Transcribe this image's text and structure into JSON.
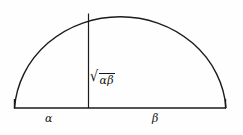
{
  "figure": {
    "kind": "geometric-mean-semicircle",
    "background_color": "#fefefe",
    "stroke_color": "#1b1b1b",
    "labels": {
      "left_segment": "α",
      "right_segment": "β",
      "altitude_radical_sign": "√",
      "altitude_radicand": "αβ"
    },
    "geometry": {
      "baseline_y": 108,
      "left_endpoint_x": 14,
      "right_endpoint_x": 226,
      "foot_x": 88,
      "apex_y": 10,
      "semicircle_center_x": 120,
      "semicircle_radius_x": 106,
      "semicircle_radius_y": 98,
      "altitude_top_y": 14
    }
  }
}
